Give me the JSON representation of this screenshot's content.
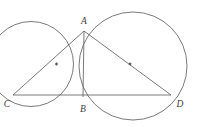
{
  "figure": {
    "width": 197,
    "height": 127,
    "background_color": "#ffffff",
    "stroke_color": "#6b6b6b",
    "label_color": "#3d3d3d",
    "stroke_width": 0.9
  },
  "labels": {
    "a": "A",
    "b": "B",
    "c": "C",
    "d": "D"
  },
  "points": {
    "A": {
      "x": 84,
      "y": 31,
      "label": "A",
      "label_x": 84,
      "label_y": 24
    },
    "B": {
      "x": 83,
      "y": 97,
      "label": "B",
      "label_x": 83,
      "label_y": 112
    },
    "C": {
      "x": 13,
      "y": 95,
      "label": "C",
      "label_x": 7,
      "label_y": 107
    },
    "D": {
      "x": 171,
      "y": 95,
      "label": "D",
      "label_x": 180,
      "label_y": 107
    }
  },
  "circles": [
    {
      "name": "left-circle",
      "through": "C, A, B",
      "cx": 31,
      "cy": 64,
      "r": 42.5
    },
    {
      "name": "right-circle",
      "through": "A, B, D",
      "cx": 133,
      "cy": 66,
      "r": 54
    }
  ],
  "segments": [
    {
      "name": "segment-CA",
      "x1": 13,
      "y1": 95,
      "x2": 84,
      "y2": 31
    },
    {
      "name": "segment-AD",
      "x1": 84,
      "y1": 31,
      "x2": 171,
      "y2": 95
    },
    {
      "name": "segment-CD",
      "x1": 13,
      "y1": 95,
      "x2": 171,
      "y2": 95
    },
    {
      "name": "segment-AB",
      "x1": 84,
      "y1": 31,
      "x2": 83,
      "y2": 97
    }
  ],
  "midpoint_markers": [
    {
      "name": "midpoint-marker-CA",
      "x": 56.5,
      "y": 64.0,
      "size": 2.4,
      "angle": -42
    },
    {
      "name": "midpoint-marker-AD",
      "x": 130.0,
      "y": 64.0,
      "size": 2.4,
      "angle": 36
    }
  ]
}
